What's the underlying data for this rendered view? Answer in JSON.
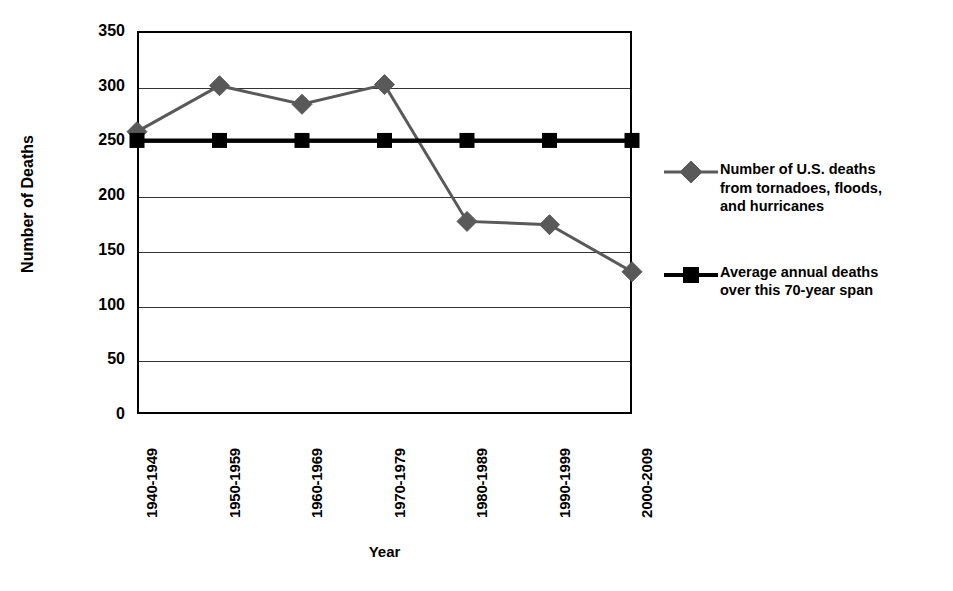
{
  "chart_data": {
    "type": "line",
    "title": "",
    "xlabel": "Year",
    "ylabel": "Number of Deaths",
    "categories": [
      "1940-1949",
      "1950-1959",
      "1960-1969",
      "1970-1979",
      "1980-1989",
      "1990-1999",
      "2000-2009"
    ],
    "ylim": [
      0,
      350
    ],
    "yticks": [
      0,
      50,
      100,
      150,
      200,
      250,
      300,
      350
    ],
    "ytick_labels": [
      "0",
      "50",
      "100",
      "150",
      "200",
      "250",
      "300",
      "350"
    ],
    "grid": true,
    "legend_position": "right",
    "series": [
      {
        "name": "Number of U.S. deaths from tornadoes, floods, and hurricanes",
        "values": [
          258,
          300,
          283,
          301,
          176,
          173,
          130
        ],
        "color": "#595959",
        "marker": "diamond"
      },
      {
        "name": "Average annual deaths over this 70-year span",
        "values": [
          250,
          250,
          250,
          250,
          250,
          250,
          250
        ],
        "color": "#000000",
        "marker": "square"
      }
    ]
  },
  "axes": {
    "y_title": "Number of Deaths",
    "x_title": "Year"
  },
  "legend": {
    "entries": [
      {
        "label": "Number of U.S. deaths\nfrom tornadoes, floods,\nand hurricanes",
        "marker": "diamond-marker",
        "color": "#595959"
      },
      {
        "label": "Average annual deaths\nover this 70-year span",
        "marker": "square-marker",
        "color": "#000000"
      }
    ]
  },
  "colors": {
    "background": "#ffffff",
    "axis": "#000000",
    "grid": "#333333",
    "series_primary": "#595959",
    "series_average": "#000000"
  }
}
